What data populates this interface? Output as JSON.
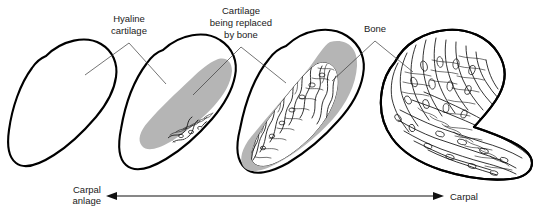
{
  "figure": {
    "background_color": "#ffffff",
    "outline_color": "#000000",
    "cartilage_color": "#b5b5b5",
    "bone_color": "#111111",
    "label_color": "#1a1a1a",
    "width": 541,
    "height": 211
  },
  "labels": {
    "hyaline_cartilage_line1": "Hyaline",
    "hyaline_cartilage_line2": "cartilage",
    "cartilage_replaced_line1": "Cartilage",
    "cartilage_replaced_line2": "being replaced",
    "cartilage_replaced_line3": "by bone",
    "bone": "Bone",
    "carpal_anlage_line1": "Carpal",
    "carpal_anlage_line2": "anlage",
    "carpal": "Carpal"
  },
  "stages": [
    {
      "index": 1,
      "name": "carpal-anlage",
      "caption": "Carpal anlage",
      "cartilage_present": true,
      "ossified_fraction_percent": 0,
      "description": "Entirely hyaline cartilage outline, no ossification center"
    },
    {
      "index": 2,
      "name": "early-ossification",
      "caption": "Cartilage being replaced by bone",
      "cartilage_present": true,
      "ossified_fraction_percent": 12,
      "description": "Small primary ossification center within grey cartilage core"
    },
    {
      "index": 3,
      "name": "advanced-ossification",
      "caption": "Cartilage being replaced by bone",
      "cartilage_present": true,
      "ossified_fraction_percent": 55,
      "description": "Large trabecular bone mass expanding within grey cartilage"
    },
    {
      "index": 4,
      "name": "mature-carpal",
      "caption": "Carpal",
      "cartilage_present": false,
      "ossified_fraction_percent": 100,
      "description": "Fully ossified carpal bone with trabecular architecture"
    }
  ],
  "progression_axis": {
    "type": "double-headed-arrow",
    "left_label": "Carpal anlage",
    "right_label": "Carpal",
    "direction": "bidirectional"
  }
}
